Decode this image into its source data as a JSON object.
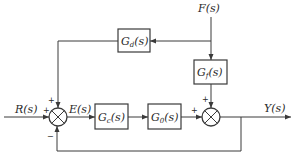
{
  "diagram": {
    "type": "control-system-block-diagram",
    "signals": {
      "input": "R(s)",
      "error": "E(s)",
      "disturbance": "F(s)",
      "output": "Y(s)"
    },
    "blocks": {
      "disturbance_feedforward": {
        "base": "G",
        "sub": "d",
        "arg": "(s)"
      },
      "disturbance_path": {
        "base": "G",
        "sub": "f",
        "arg": "(s)"
      },
      "controller": {
        "base": "G",
        "sub": "c",
        "arg": "(s)"
      },
      "plant": {
        "base": "G",
        "sub": "0",
        "arg": "(s)"
      }
    },
    "junctions": {
      "left": {
        "input_sign": "+",
        "feedforward_sign": "+",
        "feedback_sign": "−"
      },
      "right": {
        "plant_sign": "+",
        "disturbance_sign": "+"
      }
    },
    "colors": {
      "line": "#3a3a3a",
      "text": "#2a2a2a",
      "background": "#ffffff"
    }
  }
}
